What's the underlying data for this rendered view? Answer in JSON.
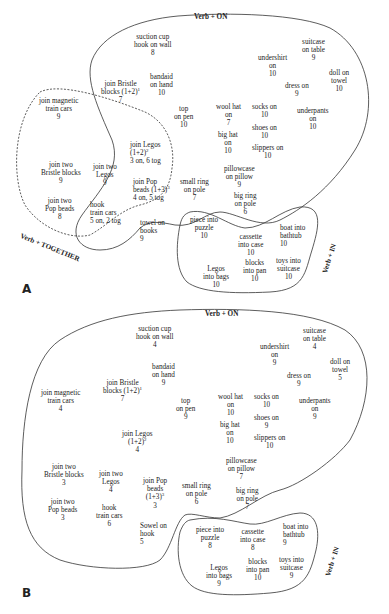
{
  "panels": {
    "A": {
      "letter": "A",
      "labels": {
        "on": "Verb + ON",
        "together": "Verb + TOGETHER",
        "in": "Verb + IN"
      },
      "items": [
        {
          "l1": "suction cup",
          "l2": "hook on wall",
          "n": "8"
        },
        {
          "l1": "bandaid",
          "l2": "on hand",
          "n": "10"
        },
        {
          "l1": "join Bristle",
          "l2": "blocks (1+2)",
          "sup": "1",
          "n": "7"
        },
        {
          "l1": "join magnetic",
          "l2": "train cars",
          "n": "9"
        },
        {
          "l1": "top",
          "l2": "on pen",
          "n": "10"
        },
        {
          "l1": "undershirt",
          "l2": "on",
          "n": "10"
        },
        {
          "l1": "suitcase",
          "l2": "on table",
          "n": "9"
        },
        {
          "l1": "doll on",
          "l2": "towel",
          "n": "10"
        },
        {
          "l1": "dress on",
          "l2": "",
          "n": "9"
        },
        {
          "l1": "wool hat",
          "l2": "on",
          "n": "7"
        },
        {
          "l1": "socks on",
          "l2": "",
          "n": "10"
        },
        {
          "l1": "underpants",
          "l2": "on",
          "n": "10"
        },
        {
          "l1": "big hat",
          "l2": "on",
          "n": "10"
        },
        {
          "l1": "shoes on",
          "l2": "",
          "n": "10"
        },
        {
          "l1": "slippers on",
          "l2": "",
          "n": "10"
        },
        {
          "l1": "join Legos",
          "l2": "(1+2)",
          "sup": "2",
          "n": "3 on, 6 tog"
        },
        {
          "l1": "join two",
          "l2": "Bristle blocks",
          "n": "9"
        },
        {
          "l1": "join two",
          "l2": "Legos",
          "n": "9"
        },
        {
          "l1": "join Pop",
          "l2": "beads (1+3)",
          "sup": "3",
          "n": "4 on, 5 tog"
        },
        {
          "l1": "pillowcase",
          "l2": "on pillow",
          "n": "9"
        },
        {
          "l1": "small ring",
          "l2": "on pole",
          "n": "7"
        },
        {
          "l1": "big ring",
          "l2": "on pole",
          "n": "6"
        },
        {
          "l1": "join two",
          "l2": "Pop beads",
          "n": "8"
        },
        {
          "l1": "hook",
          "l2": "train cars",
          "n": "5 on, 2 tog"
        },
        {
          "l1": "towel on",
          "l2": "books",
          "n": "9"
        },
        {
          "l1": "piece into",
          "l2": "puzzle",
          "n": "10"
        },
        {
          "l1": "cassette",
          "l2": "into case",
          "n": "10"
        },
        {
          "l1": "boat into",
          "l2": "bathtub",
          "n": "10"
        },
        {
          "l1": "blocks",
          "l2": "into pan",
          "n": "10"
        },
        {
          "l1": "toys into",
          "l2": "suitcase",
          "n": "10"
        },
        {
          "l1": "Legos",
          "l2": "into bags",
          "n": "10"
        }
      ]
    },
    "B": {
      "letter": "B",
      "labels": {
        "on": "Verb + ON",
        "in": "Verb + IN"
      },
      "items": [
        {
          "l1": "suction cup",
          "l2": "hook on wall",
          "n": "4"
        },
        {
          "l1": "bandaid",
          "l2": "on hand",
          "n": "9"
        },
        {
          "l1": "join Bristle",
          "l2": "blocks (1+2)",
          "sup": "1",
          "n": "7"
        },
        {
          "l1": "join magnetic",
          "l2": "train cars",
          "n": "4"
        },
        {
          "l1": "top",
          "l2": "on pen",
          "n": "9"
        },
        {
          "l1": "undershirt",
          "l2": "on",
          "n": "9"
        },
        {
          "l1": "suitcase",
          "l2": "on table",
          "n": "4"
        },
        {
          "l1": "doll on",
          "l2": "towel",
          "n": "5"
        },
        {
          "l1": "dress on",
          "l2": "",
          "n": "9"
        },
        {
          "l1": "wool hat",
          "l2": "on",
          "n": "10"
        },
        {
          "l1": "socks on",
          "l2": "",
          "n": "10"
        },
        {
          "l1": "underpants",
          "l2": "on",
          "n": "9"
        },
        {
          "l1": "big hat",
          "l2": "on",
          "n": "10"
        },
        {
          "l1": "shoes on",
          "l2": "",
          "n": "9"
        },
        {
          "l1": "slippers on",
          "l2": "",
          "n": "10"
        },
        {
          "l1": "join Legos",
          "l2": "(1+2)",
          "sup": "2",
          "n": "4"
        },
        {
          "l1": "join two",
          "l2": "Bristle blocks",
          "n": "3"
        },
        {
          "l1": "join two",
          "l2": "Legos",
          "n": "4"
        },
        {
          "l1": "join Pop",
          "l2": "beads",
          "l3": "(1+3)",
          "sup": "3",
          "n": "3"
        },
        {
          "l1": "pillowcase",
          "l2": "on pillow",
          "n": "7"
        },
        {
          "l1": "small ring",
          "l2": "on pole",
          "n": "6"
        },
        {
          "l1": "big ring",
          "l2": "on pole",
          "n": "7"
        },
        {
          "l1": "join two",
          "l2": "Pop beads",
          "n": "3"
        },
        {
          "l1": "hook",
          "l2": "train cars",
          "n": "6"
        },
        {
          "l1": "Sowel on",
          "l2": "hook",
          "n": "5"
        },
        {
          "l1": "piece into",
          "l2": "puzzle",
          "n": "8"
        },
        {
          "l1": "cassette",
          "l2": "into case",
          "n": "8"
        },
        {
          "l1": "boat into",
          "l2": "bathtub",
          "n": "9"
        },
        {
          "l1": "blocks",
          "l2": "into pan",
          "n": "10"
        },
        {
          "l1": "toys into",
          "l2": "suitcase",
          "n": "9"
        },
        {
          "l1": "Legos",
          "l2": "into bags",
          "n": "9"
        }
      ]
    }
  }
}
